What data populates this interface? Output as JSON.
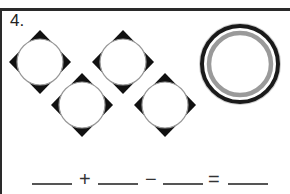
{
  "question": {
    "number": "4."
  },
  "picture": {
    "diamonds": [
      {
        "cx": 40,
        "cy": 62
      },
      {
        "cx": 123,
        "cy": 62
      },
      {
        "cx": 82,
        "cy": 105
      },
      {
        "cx": 165,
        "cy": 105
      }
    ],
    "diamond_count": 4,
    "ring": {
      "cx": 240,
      "cy": 64,
      "outer_color": "#1a1a1a",
      "inner_color": "#9a9a9a"
    }
  },
  "equation": {
    "plus": "+",
    "minus": "−",
    "equals": "=",
    "blanks": [
      "",
      "",
      "",
      ""
    ]
  }
}
